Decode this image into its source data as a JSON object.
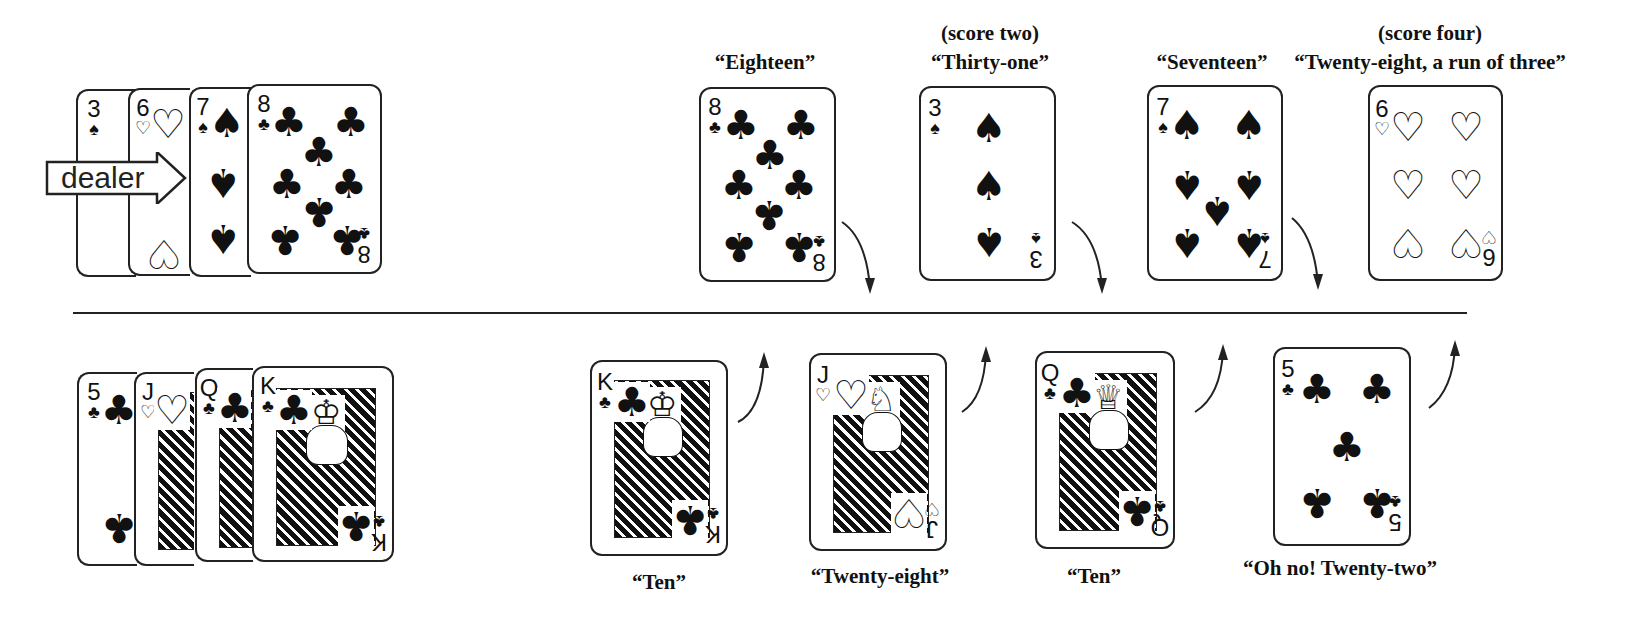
{
  "diagram": {
    "divider": "horizontal line separating dealer (top) from non-dealer (bottom)",
    "dealer_label": "dealer",
    "dealer_hand": [
      {
        "rank": "3",
        "suit": "spades",
        "suit_glyph": "♠"
      },
      {
        "rank": "6",
        "suit": "hearts",
        "suit_glyph": "♡"
      },
      {
        "rank": "7",
        "suit": "spades",
        "suit_glyph": "♠"
      },
      {
        "rank": "8",
        "suit": "clubs",
        "suit_glyph": "♣"
      }
    ],
    "opponent_hand": [
      {
        "rank": "5",
        "suit": "clubs",
        "suit_glyph": "♣"
      },
      {
        "rank": "J",
        "suit": "hearts",
        "suit_glyph": "♡"
      },
      {
        "rank": "Q",
        "suit": "clubs",
        "suit_glyph": "♣"
      },
      {
        "rank": "K",
        "suit": "clubs",
        "suit_glyph": "♣"
      }
    ],
    "play_top": [
      {
        "rank": "8",
        "suit": "clubs",
        "suit_glyph": "♣",
        "call": "“Eighteen”",
        "score": ""
      },
      {
        "rank": "3",
        "suit": "spades",
        "suit_glyph": "♠",
        "call": "“Thirty-one”",
        "score": "(score two)"
      },
      {
        "rank": "7",
        "suit": "spades",
        "suit_glyph": "♠",
        "call": "“Seventeen”",
        "score": ""
      },
      {
        "rank": "6",
        "suit": "hearts",
        "suit_glyph": "♡",
        "call": "“Twenty-eight, a run of three”",
        "score": "(score four)"
      }
    ],
    "play_bottom": [
      {
        "rank": "K",
        "suit": "clubs",
        "suit_glyph": "♣",
        "call": "“Ten”"
      },
      {
        "rank": "J",
        "suit": "hearts",
        "suit_glyph": "♡",
        "call": "“Twenty-eight”"
      },
      {
        "rank": "Q",
        "suit": "clubs",
        "suit_glyph": "♣",
        "call": "“Ten”"
      },
      {
        "rank": "5",
        "suit": "clubs",
        "suit_glyph": "♣",
        "call": "“Oh no! Twenty-two”"
      }
    ],
    "face_glyphs": {
      "king": "♔",
      "queen": "♕",
      "jack": "♘"
    }
  }
}
